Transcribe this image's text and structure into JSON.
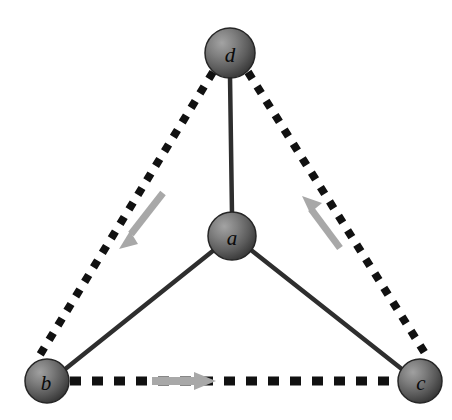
{
  "figure": {
    "background_color": "#ffffff",
    "width": 452,
    "height": 420
  },
  "style": {
    "solid_edge_color": "#2e2e2e",
    "dashed_edge_color": "#111111",
    "arrow_color": "#a8a8a8",
    "node_fill_light": "#9a9a9a",
    "node_fill_mid": "#6e6e6e",
    "node_fill_dark": "#3d3d3d",
    "node_stroke_color": "#262626",
    "label_color": "#0a0a0a"
  },
  "nodes": [
    {
      "id": "d",
      "label": "d",
      "cx": 230,
      "cy": 53,
      "r": 25,
      "label_x": 230,
      "label_y": 54
    },
    {
      "id": "a",
      "label": "a",
      "cx": 232,
      "cy": 236,
      "r": 24,
      "label_x": 232,
      "label_y": 237
    },
    {
      "id": "b",
      "label": "b",
      "cx": 47,
      "cy": 381,
      "r": 22,
      "label_x": 46,
      "label_y": 382
    },
    {
      "id": "c",
      "label": "c",
      "cx": 420,
      "cy": 381,
      "r": 22,
      "label_x": 421,
      "label_y": 382
    }
  ],
  "edges": [
    {
      "id": "a-d",
      "from": "a",
      "to": "d",
      "style": "solid",
      "x1": 232,
      "y1": 212,
      "x2": 230,
      "y2": 78
    },
    {
      "id": "a-b",
      "from": "a",
      "to": "b",
      "style": "solid",
      "x1": 213,
      "y1": 251,
      "x2": 65,
      "y2": 369
    },
    {
      "id": "a-c",
      "from": "a",
      "to": "c",
      "style": "solid",
      "x1": 252,
      "y1": 251,
      "x2": 402,
      "y2": 370
    },
    {
      "id": "d-b",
      "from": "d",
      "to": "b",
      "style": "dashed",
      "x1": 213,
      "y1": 72,
      "x2": 38,
      "y2": 358
    },
    {
      "id": "d-c",
      "from": "d",
      "to": "c",
      "style": "dashed",
      "x1": 248,
      "y1": 72,
      "x2": 428,
      "y2": 358
    },
    {
      "id": "b-c",
      "from": "b",
      "to": "c",
      "style": "dashed",
      "x1": 70,
      "y1": 381,
      "x2": 397,
      "y2": 381
    }
  ],
  "arrows": [
    {
      "id": "arrow-d-to-b",
      "from": "d",
      "to": "b",
      "direction": "down-left",
      "x1": 161,
      "y1": 195,
      "x2": 122,
      "y2": 243
    },
    {
      "id": "arrow-c-to-d",
      "from": "c",
      "to": "d",
      "direction": "up-right",
      "x1": 340,
      "y1": 247,
      "x2": 310,
      "y2": 199
    },
    {
      "id": "arrow-b-to-c",
      "from": "b",
      "to": "c",
      "direction": "right",
      "x1": 155,
      "y1": 381,
      "x2": 208,
      "y2": 381
    }
  ]
}
